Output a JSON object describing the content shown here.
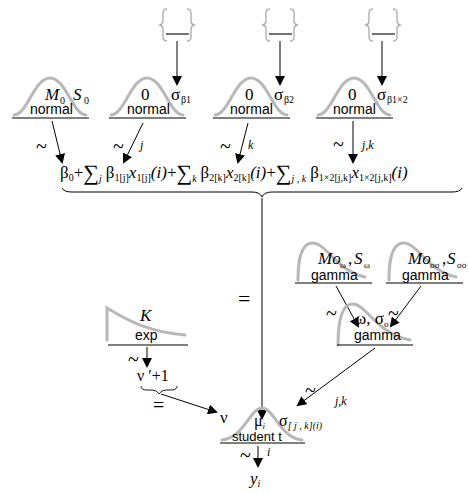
{
  "priors_top": [
    {
      "id": "b0",
      "param1": "M",
      "param1_sub": "0",
      "param2": "S",
      "param2_sub": "0",
      "dist": "normal",
      "rel": "~",
      "index": ""
    },
    {
      "id": "b1",
      "param1": "0",
      "param2": "σ",
      "param2_sub": "β1",
      "dist": "normal",
      "rel": "~",
      "index": "j"
    },
    {
      "id": "b2",
      "param1": "0",
      "param2": "σ",
      "param2_sub": "β2",
      "dist": "normal",
      "rel": "~",
      "index": "k"
    },
    {
      "id": "b12",
      "param1": "0",
      "param2": "σ",
      "param2_sub": "β1×2",
      "dist": "normal",
      "rel": "~",
      "index": "j,k"
    }
  ],
  "hyperpriors": [
    {
      "id": "sigma_b1",
      "shape": "empty-brace"
    },
    {
      "id": "sigma_b2",
      "shape": "empty-brace"
    },
    {
      "id": "sigma_b12",
      "shape": "empty-brace"
    }
  ],
  "linear_predictor": {
    "text": "β0 + Σj β1[j] x1[j](i) + Σk β2[k] x2[k](i) + Σj,k β1×2[j,k] x1×2[j,k](i)",
    "parts": {
      "b0": "β",
      "b0_sub": "0",
      "plus": "+",
      "sum": "∑",
      "j": "j",
      "k": "k",
      "jk": "j , k",
      "beta": "β",
      "x": "x",
      "sub_1j": "1[j]",
      "sub_2k": "2[k]",
      "sub_12jk": "1×2[j,k]",
      "i": "(i)"
    },
    "rel": "="
  },
  "gamma_hyper": [
    {
      "id": "omega_prior",
      "param1": "Mo",
      "param1_sub": "ω",
      "param2": "S",
      "param2_sub": "ω",
      "dist": "gamma",
      "rel": "~"
    },
    {
      "id": "sigma_sigma_prior",
      "param1": "Mo",
      "param1_sub": "σσ",
      "param2": "S",
      "param2_sub": "σσ",
      "dist": "gamma",
      "rel": "~"
    }
  ],
  "gamma_sigma": {
    "param1": "ω",
    "param2": "σ",
    "param2_sub": "σ",
    "dist": "gamma",
    "rel": "~",
    "index": "j,k"
  },
  "exp_prior": {
    "param": "K",
    "dist": "exp",
    "rel": "~"
  },
  "nu": {
    "expr": "ν ′+1",
    "rel": "=",
    "label": "ν"
  },
  "likelihood": {
    "param_mu": "μ",
    "param_mu_sub": "i",
    "param_sigma": "σ",
    "param_sigma_sub": "[ j , k](i)",
    "dist": "student t",
    "rel": "~",
    "index": "i"
  },
  "outcome": {
    "var": "y",
    "sub": "i"
  }
}
